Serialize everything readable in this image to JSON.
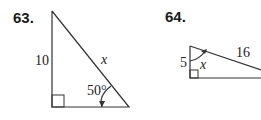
{
  "problems": [
    {
      "number": "63.",
      "figure": "right-triangle",
      "labels": {
        "vertical_leg": "10",
        "hypotenuse": "x",
        "angle": "50°"
      }
    },
    {
      "number": "64.",
      "figure": "right-triangle",
      "labels": {
        "vertical_leg": "5",
        "hypotenuse": "16",
        "angle": "x"
      }
    }
  ],
  "colors": {
    "stroke": "#333333",
    "text": "#1a1a1a"
  }
}
